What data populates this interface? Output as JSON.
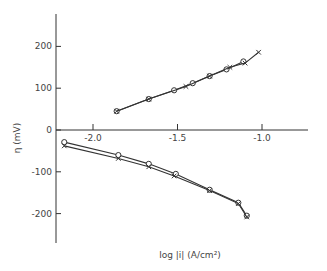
{
  "chart_data": {
    "type": "line",
    "title": "",
    "xlabel": "log |i| (A/cm²)",
    "ylabel": "η (mV)",
    "xlim": [
      -2.2,
      -0.95
    ],
    "ylim": [
      -270,
      280
    ],
    "grid": false,
    "legend": null,
    "x_ticks": [
      {
        "value": -2.0,
        "label": "-2.0"
      },
      {
        "value": -1.5,
        "label": "-1.5"
      },
      {
        "value": -1.0,
        "label": "-1.0"
      }
    ],
    "y_ticks": [
      {
        "value": 200,
        "label": "200"
      },
      {
        "value": 100,
        "label": "100"
      },
      {
        "value": 0,
        "label": "0"
      },
      {
        "value": -100,
        "label": "-100"
      },
      {
        "value": -200,
        "label": "-200"
      }
    ],
    "series": [
      {
        "name": "anodic (circles)",
        "marker": "circle",
        "x": [
          -1.86,
          -1.67,
          -1.52,
          -1.41,
          -1.31,
          -1.21,
          -1.11
        ],
        "y": [
          45,
          74,
          95,
          112,
          129,
          145,
          164
        ]
      },
      {
        "name": "anodic (crosses)",
        "marker": "x",
        "x": [
          -1.86,
          -1.67,
          -1.45,
          -1.31,
          -1.19,
          -1.1,
          -1.02
        ],
        "y": [
          45,
          74,
          104,
          129,
          150,
          160,
          186
        ]
      },
      {
        "name": "cathodic (circles)",
        "marker": "circle",
        "x": [
          -2.17,
          -1.85,
          -1.67,
          -1.51,
          -1.31,
          -1.14,
          -1.09
        ],
        "y": [
          -29,
          -60,
          -81,
          -105,
          -143,
          -174,
          -205
        ]
      },
      {
        "name": "cathodic (crosses)",
        "marker": "x",
        "x": [
          -2.17,
          -1.85,
          -1.67,
          -1.52,
          -1.31,
          -1.14,
          -1.09
        ],
        "y": [
          -38,
          -68,
          -88,
          -110,
          -145,
          -176,
          -208
        ]
      }
    ]
  }
}
